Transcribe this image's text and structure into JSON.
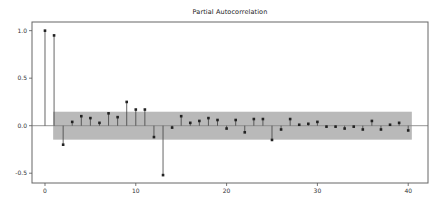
{
  "figure": {
    "background": "#ffffff"
  },
  "chart_data": {
    "type": "stem",
    "title": "Partial Autocorrelation",
    "xlabel": "",
    "ylabel": "",
    "x": [
      0,
      1,
      2,
      3,
      4,
      5,
      6,
      7,
      8,
      9,
      10,
      11,
      12,
      13,
      14,
      15,
      16,
      17,
      18,
      19,
      20,
      21,
      22,
      23,
      24,
      25,
      26,
      27,
      28,
      29,
      30,
      31,
      32,
      33,
      34,
      35,
      36,
      37,
      38,
      39,
      40
    ],
    "values": [
      1.0,
      0.95,
      -0.2,
      0.04,
      0.1,
      0.08,
      0.03,
      0.13,
      0.09,
      0.25,
      0.17,
      0.17,
      -0.12,
      -0.52,
      -0.02,
      0.1,
      0.03,
      0.05,
      0.08,
      0.06,
      -0.03,
      0.06,
      -0.07,
      0.07,
      0.07,
      -0.15,
      -0.04,
      0.07,
      0.01,
      0.02,
      0.04,
      -0.01,
      -0.01,
      -0.03,
      -0.01,
      -0.04,
      0.05,
      -0.04,
      0.01,
      0.03,
      -0.05
    ],
    "confidence_band": {
      "upper": 0.147,
      "lower": -0.147,
      "x_start": 0.9,
      "x_end": 40.4,
      "color": "#b9b9b9"
    },
    "xlim": [
      -1.43,
      42.18
    ],
    "ylim": [
      -0.603,
      1.091
    ],
    "xticks": [
      0,
      10,
      20,
      30,
      40
    ],
    "xtick_labels": [
      "0",
      "10",
      "20",
      "30",
      "40"
    ],
    "yticks": [
      1.0,
      0.5,
      0.0,
      -0.5
    ],
    "ytick_labels": [
      "1.0",
      "0.5",
      "0.0",
      "-0.5"
    ],
    "grid": false,
    "legend": "none",
    "colors": {
      "spine": "#666666",
      "baseline": "#8a8a8a",
      "stem": "#404040",
      "marker": "#222222",
      "tick": "#555555",
      "tick_text": "#333333"
    }
  }
}
